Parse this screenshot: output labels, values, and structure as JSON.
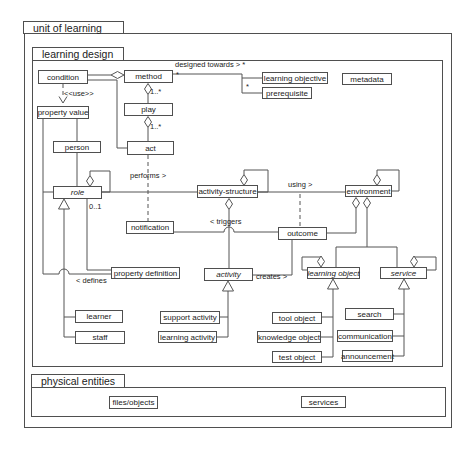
{
  "diagram": {
    "colors": {
      "line": "#555555",
      "border": "#4f4f4f",
      "text": "#222222",
      "background": "#ffffff"
    },
    "packages": [
      {
        "id": "unit-of-learning",
        "label": "unit of learning",
        "tab": {
          "x": 23,
          "y": 21,
          "w": 101,
          "h": 13
        },
        "frame": {
          "x": 24,
          "y": 33,
          "w": 428,
          "h": 395
        }
      },
      {
        "id": "learning-design",
        "label": "learning design",
        "tab": {
          "x": 32,
          "y": 47,
          "w": 92,
          "h": 14
        },
        "frame": {
          "x": 32,
          "y": 60,
          "w": 411,
          "h": 307
        }
      },
      {
        "id": "physical-entities",
        "label": "physical entities",
        "tab": {
          "x": 31,
          "y": 374,
          "w": 94,
          "h": 14
        },
        "frame": {
          "x": 31,
          "y": 387,
          "w": 415,
          "h": 30
        }
      }
    ],
    "nodes": [
      {
        "id": "condition",
        "label": "condition",
        "x": 38,
        "y": 70,
        "w": 50,
        "h": 14,
        "italic": false
      },
      {
        "id": "method",
        "label": "method",
        "x": 124,
        "y": 70,
        "w": 49,
        "h": 13,
        "italic": false
      },
      {
        "id": "learning-objective",
        "label": "learning objective",
        "x": 262,
        "y": 72,
        "w": 66,
        "h": 12,
        "italic": false
      },
      {
        "id": "prerequisite",
        "label": "prerequisite",
        "x": 262,
        "y": 87,
        "w": 50,
        "h": 12,
        "italic": false
      },
      {
        "id": "metadata",
        "label": "metadata",
        "x": 342,
        "y": 73,
        "w": 50,
        "h": 12,
        "italic": false
      },
      {
        "id": "property-value",
        "label": "property value",
        "x": 37,
        "y": 106,
        "w": 52,
        "h": 13,
        "italic": false
      },
      {
        "id": "play",
        "label": "play",
        "x": 124,
        "y": 103,
        "w": 49,
        "h": 13,
        "italic": false
      },
      {
        "id": "person",
        "label": "person",
        "x": 53,
        "y": 141,
        "w": 48,
        "h": 12,
        "italic": false
      },
      {
        "id": "act",
        "label": "act",
        "x": 127,
        "y": 141,
        "w": 47,
        "h": 14,
        "italic": false
      },
      {
        "id": "role",
        "label": "role",
        "x": 53,
        "y": 186,
        "w": 49,
        "h": 13,
        "italic": true
      },
      {
        "id": "activity-structure",
        "label": "activity-structure",
        "x": 197,
        "y": 185,
        "w": 61,
        "h": 13,
        "italic": false
      },
      {
        "id": "environment",
        "label": "environment",
        "x": 345,
        "y": 185,
        "w": 47,
        "h": 12,
        "italic": false
      },
      {
        "id": "notification",
        "label": "notification",
        "x": 126,
        "y": 221,
        "w": 48,
        "h": 13,
        "italic": false
      },
      {
        "id": "outcome",
        "label": "outcome",
        "x": 278,
        "y": 227,
        "w": 49,
        "h": 13,
        "italic": false
      },
      {
        "id": "property-definition",
        "label": "property definition",
        "x": 111,
        "y": 267,
        "w": 69,
        "h": 12,
        "italic": false
      },
      {
        "id": "activity",
        "label": "activity",
        "x": 204,
        "y": 268,
        "w": 49,
        "h": 13,
        "italic": true
      },
      {
        "id": "learning-object",
        "label": "learning object",
        "x": 307,
        "y": 267,
        "w": 53,
        "h": 12,
        "italic": true
      },
      {
        "id": "service",
        "label": "service",
        "x": 380,
        "y": 267,
        "w": 47,
        "h": 12,
        "italic": true
      },
      {
        "id": "learner",
        "label": "learner",
        "x": 75,
        "y": 310,
        "w": 48,
        "h": 13,
        "italic": false
      },
      {
        "id": "staff",
        "label": "staff",
        "x": 75,
        "y": 331,
        "w": 50,
        "h": 13,
        "italic": false
      },
      {
        "id": "support-activity",
        "label": "support activity",
        "x": 160,
        "y": 311,
        "w": 60,
        "h": 13,
        "italic": false
      },
      {
        "id": "learning-activity",
        "label": "learning activity",
        "x": 158,
        "y": 331,
        "w": 59,
        "h": 12,
        "italic": false
      },
      {
        "id": "tool-object",
        "label": "tool object",
        "x": 272,
        "y": 312,
        "w": 50,
        "h": 12,
        "italic": false
      },
      {
        "id": "knowledge-object",
        "label": "knowledge object",
        "x": 257,
        "y": 331,
        "w": 64,
        "h": 12,
        "italic": false
      },
      {
        "id": "test-object",
        "label": "test object",
        "x": 272,
        "y": 351,
        "w": 50,
        "h": 12,
        "italic": false
      },
      {
        "id": "search",
        "label": "search",
        "x": 345,
        "y": 308,
        "w": 49,
        "h": 12,
        "italic": false
      },
      {
        "id": "communication",
        "label": "communication",
        "x": 337,
        "y": 330,
        "w": 56,
        "h": 12,
        "italic": false
      },
      {
        "id": "announcement",
        "label": "announcement",
        "x": 342,
        "y": 350,
        "w": 51,
        "h": 12,
        "italic": false
      },
      {
        "id": "files-objects",
        "label": "files/objects",
        "x": 109,
        "y": 396,
        "w": 49,
        "h": 13,
        "italic": false
      },
      {
        "id": "services",
        "label": "services",
        "x": 301,
        "y": 396,
        "w": 45,
        "h": 12,
        "italic": false
      }
    ],
    "edge_labels": [
      {
        "id": "designed-towards",
        "text": "designed towards > *",
        "x": 175,
        "y": 61
      },
      {
        "id": "mult-method-end",
        "text": "*",
        "x": 176,
        "y": 71
      },
      {
        "id": "mult-prereq-end",
        "text": "*",
        "x": 246,
        "y": 83
      },
      {
        "id": "use-stereotype",
        "text": "<<use>>",
        "x": 64,
        "y": 90
      },
      {
        "id": "mult-method-play",
        "text": "1..*",
        "x": 150,
        "y": 88
      },
      {
        "id": "mult-play-act",
        "text": "1..*",
        "x": 150,
        "y": 123
      },
      {
        "id": "performs",
        "text": "performs >",
        "x": 130,
        "y": 172
      },
      {
        "id": "using",
        "text": "using >",
        "x": 288,
        "y": 181
      },
      {
        "id": "mult-role-propdef",
        "text": "0..1",
        "x": 89,
        "y": 203
      },
      {
        "id": "triggers",
        "text": "< triggers",
        "x": 210,
        "y": 218
      },
      {
        "id": "defines",
        "text": "< defines",
        "x": 76,
        "y": 277
      },
      {
        "id": "creates",
        "text": "creates >",
        "x": 256,
        "y": 273
      }
    ],
    "edges": [
      {
        "name": "condition-method-aggregation",
        "d": "M88,75 L111,75",
        "dashed": false
      },
      {
        "name": "condition-act",
        "d": "M88,80 L117,80 L117,148 L127,148",
        "dashed": false
      },
      {
        "name": "method-designed-towards-fork",
        "d": "M173,74 L242,74 L242,93 M242,78 L262,78 M242,93 L262,93",
        "dashed": false
      },
      {
        "name": "condition-property-value-use",
        "d": "M63,84 L63,96",
        "dashed": true
      },
      {
        "name": "method-play-aggregation",
        "d": "M148,94.5 L148,103",
        "dashed": false
      },
      {
        "name": "play-act-aggregation",
        "d": "M148,127.5 L148,141",
        "dashed": false
      },
      {
        "name": "act-notification-dependency",
        "d": "M148,155 L148,221",
        "dashed": true
      },
      {
        "name": "property-value-person",
        "d": "M77,119 L77,141",
        "dashed": false
      },
      {
        "name": "person-role",
        "d": "M77,153 L77,186",
        "dashed": false
      },
      {
        "name": "property-value-role-defines",
        "d": "M43,119 L43,274 M43,192 L53,192 M43,274 L59,274 M69,274 L111,274 M59,274 A5 5 0 0 1 69,274",
        "dashed": false
      },
      {
        "name": "role-generalization-trunk",
        "d": "M64,209 L64,337 L75,337 M64,317 L75,317",
        "dashed": false
      },
      {
        "name": "role-self-loop",
        "d": "M90,175.5 L90,171 L110,171 L110,192 L102,192",
        "dashed": false
      },
      {
        "name": "role-property-definition",
        "d": "M87,199 L87,270 L111,270",
        "dashed": false
      },
      {
        "name": "role-performs-activity-structure",
        "d": "M102,192 L197,192",
        "dashed": false
      },
      {
        "name": "activity-structure-self-loop",
        "d": "M244,174.5 L244,170 L268,170 L268,192 L258,192",
        "dashed": false
      },
      {
        "name": "activity-structure-using-environment",
        "d": "M258,192 L345,192",
        "dashed": false
      },
      {
        "name": "using-outcome-dependency",
        "d": "M300,194 L300,227",
        "dashed": true
      },
      {
        "name": "activity-structure-activity",
        "d": "M229,209.5 L229,268",
        "dashed": false
      },
      {
        "name": "notification-outcome-triggers",
        "d": "M174,232 L224,232 M234,232 L278,232 M224,232 A5 5 0 0 1 234,232",
        "dashed": false
      },
      {
        "name": "environment-outcome-aggregation",
        "d": "M356,208.5 L356,233 L327,233",
        "dashed": false
      },
      {
        "name": "environment-objects-branch",
        "d": "M367,208.5 L367,247 M336,247 L397,247 M336,247 L336,267 M397,247 L397,267",
        "dashed": false
      },
      {
        "name": "environment-self-loop",
        "d": "M377,174.5 L377,170 L399,170 L399,191 L392,191",
        "dashed": false
      },
      {
        "name": "activity-creates-outcome",
        "d": "M253,275 L292,275 L292,240",
        "dashed": false
      },
      {
        "name": "activity-generalization-trunk",
        "d": "M228,291 L228,337 L217,337 M228,317 L220,317",
        "dashed": false
      },
      {
        "name": "learning-object-self-loop",
        "d": "M321,257 L302,257 L302,270 L307,270",
        "dashed": false
      },
      {
        "name": "learning-object-generalization-trunk",
        "d": "M333,289 L333,357 L322,357 M333,317 L322,317 M333,337 L321,337",
        "dashed": false
      },
      {
        "name": "service-self-loop",
        "d": "M414,257 L436,257 L436,270 L427,270",
        "dashed": false
      },
      {
        "name": "service-generalization-trunk",
        "d": "M404,289 L404,356 L393,356 M404,314 L394,314 M404,336 L393,336",
        "dashed": false
      }
    ],
    "diamonds": [
      {
        "name": "aggregation-diamond-method-left",
        "cx": 117.5,
        "cy": 75,
        "orient": "h"
      },
      {
        "name": "aggregation-diamond-method-play",
        "cx": 148,
        "cy": 89,
        "orient": "v"
      },
      {
        "name": "aggregation-diamond-play-act",
        "cx": 148,
        "cy": 122,
        "orient": "v"
      },
      {
        "name": "aggregation-diamond-role-self",
        "cx": 90,
        "cy": 181,
        "orient": "v"
      },
      {
        "name": "aggregation-diamond-structure-self",
        "cx": 244,
        "cy": 180,
        "orient": "v"
      },
      {
        "name": "aggregation-diamond-structure-activity",
        "cx": 229,
        "cy": 204,
        "orient": "v"
      },
      {
        "name": "aggregation-diamond-environment-self",
        "cx": 377,
        "cy": 180,
        "orient": "v"
      },
      {
        "name": "aggregation-diamond-environment-outcome",
        "cx": 356,
        "cy": 203,
        "orient": "v"
      },
      {
        "name": "aggregation-diamond-environment-objects",
        "cx": 367,
        "cy": 203,
        "orient": "v"
      },
      {
        "name": "aggregation-diamond-learning-object-self",
        "cx": 321,
        "cy": 261.5,
        "orient": "v"
      },
      {
        "name": "aggregation-diamond-service-self",
        "cx": 414,
        "cy": 261.5,
        "orient": "v"
      }
    ],
    "triangles": [
      {
        "name": "generalization-triangle-role",
        "cx": 64,
        "cy": 199
      },
      {
        "name": "generalization-triangle-activity",
        "cx": 228,
        "cy": 281
      },
      {
        "name": "generalization-triangle-learning-object",
        "cx": 333,
        "cy": 279
      },
      {
        "name": "generalization-triangle-service",
        "cx": 404,
        "cy": 279
      }
    ],
    "arrowheads": [
      {
        "name": "use-arrowhead",
        "d": "M59,96.5 L63,103 L67,96.5"
      }
    ]
  }
}
